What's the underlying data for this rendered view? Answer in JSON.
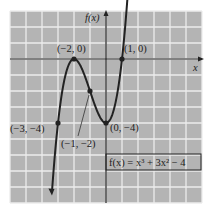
{
  "chart_data": {
    "type": "line",
    "title": "",
    "function_label": "f(x) = x³ + 3x² − 4",
    "xlabel": "x",
    "ylabel": "f(x)",
    "xlim": [
      -6,
      6
    ],
    "ylim": [
      -9,
      3
    ],
    "grid": true,
    "grid_step": 1,
    "series": [
      {
        "name": "f(x) = x^3 + 3x^2 - 4",
        "x": [
          -3.4,
          -3,
          -2.5,
          -2,
          -1.5,
          -1,
          -0.5,
          0,
          0.5,
          1,
          1.4
        ],
        "y": [
          -8.96,
          -4,
          -0.88,
          0,
          -0.63,
          -2,
          -3.38,
          -4,
          -3.13,
          0,
          4.62
        ]
      }
    ],
    "points": [
      {
        "x": -2,
        "y": 0,
        "label": "(−2, 0)"
      },
      {
        "x": 1,
        "y": 0,
        "label": "(1, 0)"
      },
      {
        "x": -3,
        "y": -4,
        "label": "(−3, −4)"
      },
      {
        "x": -1,
        "y": -2,
        "label": "(−1, −2)"
      },
      {
        "x": 0,
        "y": -4,
        "label": "(0, −4)"
      }
    ],
    "colors": {
      "background": "#b4b4b4",
      "grid": "#ececec",
      "curve": "#222222"
    }
  }
}
